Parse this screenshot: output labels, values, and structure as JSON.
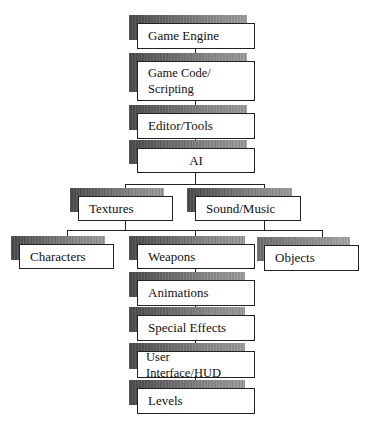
{
  "diagram": {
    "title": "",
    "type": "hierarchy",
    "colors": {
      "box_border": "#222222",
      "box_fill": "#ffffff",
      "shadow_dark": "#4a4a4a",
      "shadow_light": "#9c9c9c",
      "connector": "#222222"
    },
    "nodes": {
      "game_engine": {
        "label": "Game Engine"
      },
      "game_code": {
        "label": "Game Code/\nScripting"
      },
      "editor_tools": {
        "label": "Editor/Tools"
      },
      "ai": {
        "label": "AI"
      },
      "textures": {
        "label": "Textures"
      },
      "sound_music": {
        "label": "Sound/Music"
      },
      "characters": {
        "label": "Characters"
      },
      "weapons": {
        "label": "Weapons"
      },
      "objects": {
        "label": "Objects"
      },
      "animations": {
        "label": "Animations"
      },
      "special_effects": {
        "label": "Special Effects"
      },
      "user_interface_hud": {
        "label": "User Interface/HUD"
      },
      "levels": {
        "label": "Levels"
      }
    },
    "edges": [
      [
        "Game Engine",
        "Game Code/Scripting"
      ],
      [
        "Game Code/Scripting",
        "Editor/Tools"
      ],
      [
        "Editor/Tools",
        "AI"
      ],
      [
        "AI",
        "Textures"
      ],
      [
        "AI",
        "Sound/Music"
      ],
      [
        "Textures",
        "Characters"
      ],
      [
        "Textures",
        "Weapons"
      ],
      [
        "Sound/Music",
        "Weapons"
      ],
      [
        "Sound/Music",
        "Objects"
      ],
      [
        "Weapons",
        "Animations"
      ],
      [
        "Animations",
        "Special Effects"
      ],
      [
        "Special Effects",
        "User Interface/HUD"
      ],
      [
        "User Interface/HUD",
        "Levels"
      ]
    ]
  }
}
